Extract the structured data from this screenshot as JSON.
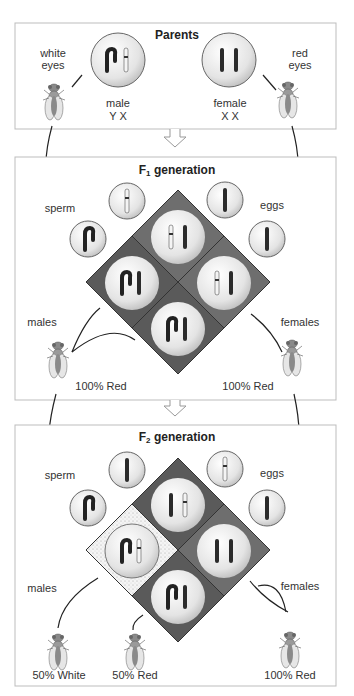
{
  "parents": {
    "title": "Parents",
    "male_fly_label_1": "white",
    "male_fly_label_2": "eyes",
    "female_fly_label_1": "red",
    "female_fly_label_2": "eyes",
    "male_label": "male",
    "male_genotype": "Y X",
    "female_label": "female",
    "female_genotype": "X X"
  },
  "f1": {
    "title_prefix": "F",
    "title_sub": "1",
    "title_suffix": " generation",
    "sperm_label": "sperm",
    "eggs_label": "eggs",
    "males_label": "males",
    "females_label": "females",
    "males_result": "100% Red",
    "females_result": "100% Red"
  },
  "f2": {
    "title_prefix": "F",
    "title_sub": "2",
    "title_suffix": " generation",
    "sperm_label": "sperm",
    "eggs_label": "eggs",
    "males_label": "males",
    "females_label": "females",
    "males_white_result": "50% White",
    "males_red_result": "50% Red",
    "females_result": "100% Red"
  },
  "colors": {
    "diamond_dark": "#5a5a5a",
    "diamond_mid": "#7a7a7a",
    "white_cell_bg": "#f2f2f2",
    "border": "#bdbdbd"
  }
}
